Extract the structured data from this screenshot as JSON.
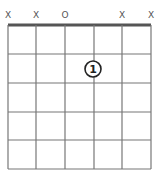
{
  "chord": {
    "string_markers": [
      "X",
      "X",
      "O",
      "",
      "X",
      "X"
    ],
    "fingers": [
      {
        "string": 4,
        "fret": 2,
        "label": "1"
      }
    ],
    "num_strings": 6,
    "num_frets": 5
  },
  "colors": {
    "grid": "#777777",
    "nut": "#555555",
    "marker": "#555555",
    "finger_stroke": "#222222"
  }
}
